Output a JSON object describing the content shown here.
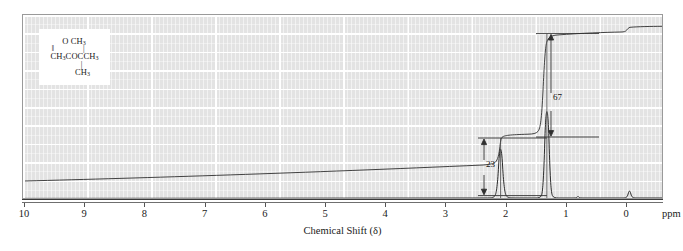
{
  "figure": {
    "kind": "nmr-spectrum",
    "xaxis_title": "Chemical Shift (δ)",
    "ppm_unit": "ppm"
  },
  "structure": {
    "caption": "CH3COC(CH3)3",
    "line_top": "O    CH",
    "line_top_sub": "3",
    "bonds_upper": "‖    |",
    "line_main_a": "CH",
    "line_main_a_sub": "3",
    "line_main_b": "COCCH",
    "line_main_b_sub": "3",
    "bond_lower": "|",
    "line_bottom": "CH",
    "line_bottom_sub": "3"
  },
  "integrals": [
    {
      "name": "integral-step-2ppm",
      "value": "23",
      "ppm": 2.05
    },
    {
      "name": "integral-step-1ppm",
      "value": "67",
      "ppm": 1.12
    }
  ],
  "axis": {
    "ticks": [
      {
        "label": "10",
        "ppm": 10
      },
      {
        "label": "9",
        "ppm": 9
      },
      {
        "label": "8",
        "ppm": 8
      },
      {
        "label": "7",
        "ppm": 7
      },
      {
        "label": "6",
        "ppm": 6
      },
      {
        "label": "5",
        "ppm": 5
      },
      {
        "label": "4",
        "ppm": 4
      },
      {
        "label": "3",
        "ppm": 3
      },
      {
        "label": "2",
        "ppm": 2
      },
      {
        "label": "1",
        "ppm": 1
      },
      {
        "label": "0",
        "ppm": 0
      }
    ]
  },
  "chart_data": {
    "type": "line",
    "title": "",
    "xlabel": "Chemical Shift (δ)",
    "ylabel": "",
    "xlim": [
      10,
      0
    ],
    "ylim": [
      0,
      100
    ],
    "grid": true,
    "legend": "none",
    "series": [
      {
        "name": "1H NMR spectrum",
        "peaks": [
          {
            "ppm": 2.05,
            "relative_height": 55,
            "assignment": "CH3 (acetyl)"
          },
          {
            "ppm": 1.12,
            "relative_height": 97,
            "assignment": "C(CH3)3 (tert-butyl)"
          },
          {
            "ppm": 0.0,
            "relative_height": 6,
            "assignment": "TMS reference"
          }
        ]
      },
      {
        "name": "integration trace",
        "steps": [
          {
            "ppm": 2.05,
            "rise": 23
          },
          {
            "ppm": 1.12,
            "rise": 67
          },
          {
            "ppm": 0.0,
            "rise": 4
          }
        ]
      }
    ],
    "annotations": [
      {
        "text": "23",
        "ppm": 2.35,
        "meaning": "integral height of 2.05 ppm signal"
      },
      {
        "text": "67",
        "ppm": 0.95,
        "meaning": "integral height of 1.12 ppm signal"
      }
    ],
    "colors": {
      "paper": "#e3e3e3",
      "gridline": "#ffffff",
      "trace": "#2b2b2b",
      "frame": "#9a9a9a"
    }
  }
}
